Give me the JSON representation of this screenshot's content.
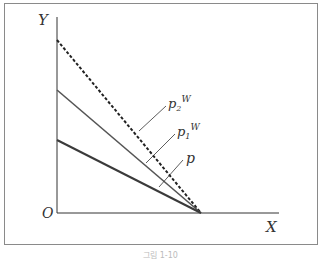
{
  "diagram": {
    "axes": {
      "x_label": "X",
      "y_label": "Y",
      "origin_label": "O"
    },
    "lines": [
      {
        "name": "p2W",
        "label_base": "p",
        "label_sub": "2",
        "label_sup": "W",
        "style": "dashed",
        "y_intercept_px": 40
      },
      {
        "name": "p1W",
        "label_base": "p",
        "label_sub": "1",
        "label_sup": "W",
        "style": "solid",
        "y_intercept_px": 90
      },
      {
        "name": "p",
        "label_base": "p",
        "label_sub": "",
        "label_sup": "",
        "style": "solid",
        "y_intercept_px": 140
      }
    ],
    "colors": {
      "axis": "#333333",
      "line_p": "#3a3a3a",
      "line_p1W": "#555555",
      "line_p2W": "#222222",
      "frame": "#8a8a8a"
    },
    "caption": "그림 1-10"
  }
}
